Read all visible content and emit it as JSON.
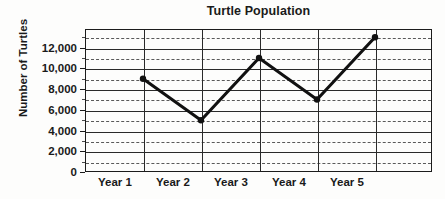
{
  "chart_data": {
    "type": "line",
    "title": "Turtle Population",
    "xlabel": "",
    "ylabel": "Number of Turtles",
    "categories": [
      "Year 1",
      "Year 2",
      "Year 3",
      "Year 4",
      "Year 5"
    ],
    "values": [
      9000,
      5000,
      11000,
      7000,
      13000
    ],
    "series": [
      {
        "name": "Number of Turtles",
        "values": [
          9000,
          5000,
          11000,
          7000,
          13000
        ]
      }
    ],
    "ylim": [
      0,
      13800
    ],
    "xlim": [
      0,
      5
    ],
    "y_major_ticks": [
      0,
      2000,
      4000,
      6000,
      8000,
      10000,
      12000
    ],
    "y_major_tick_labels": [
      "0",
      "2,000",
      "4,000",
      "6,000",
      "8,000",
      "10,000",
      "12,000"
    ],
    "y_minor_ticks": [
      1000,
      3000,
      5000,
      7000,
      9000,
      11000,
      13000
    ],
    "grid": "major-solid-horizontal, minor-dashed-horizontal, solid-vertical",
    "legend": "none",
    "marker": "filled-circle",
    "line_color": "#111111",
    "grid_color": "#2a2a2a",
    "minor_grid_color": "#5a5a5a",
    "background_color": "#fdfdfc"
  },
  "axis": {
    "y_title": "Number of Turtles",
    "y_tick_labels": [
      "12,000",
      "10,000",
      "8,000",
      "6,000",
      "4,000",
      "2,000",
      "0"
    ],
    "x_tick_labels": [
      "Year 1",
      "Year 2",
      "Year 3",
      "Year 4",
      "Year 5"
    ]
  }
}
